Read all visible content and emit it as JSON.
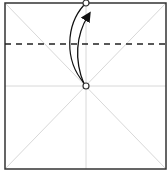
{
  "diagram": {
    "type": "origami-fold-step",
    "colors": {
      "paper_edge": "#333333",
      "crease": "#d8d8d8",
      "fold_line": "#222222",
      "arrow": "#111111",
      "background": "#ffffff"
    },
    "paper": {
      "x": 5,
      "y": 3,
      "width": 161,
      "height": 166
    },
    "fold_line_y": 44,
    "points": [
      {
        "name": "top-edge-midpoint",
        "x": 86,
        "y": 3
      },
      {
        "name": "center-point",
        "x": 86,
        "y": 86
      }
    ]
  }
}
